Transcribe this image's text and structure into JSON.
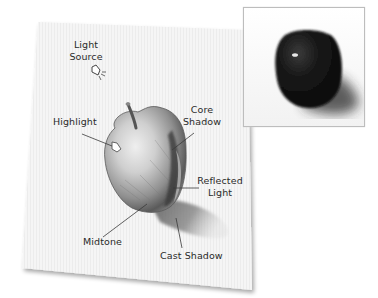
{
  "diagram": {
    "labels": {
      "light_source": [
        "Light",
        "Source"
      ],
      "highlight": "Highlight",
      "core_shadow": [
        "Core",
        "Shadow"
      ],
      "reflected_light": [
        "Reflected",
        "Light"
      ],
      "midtone": "Midtone",
      "cast_shadow": "Cast Shadow"
    },
    "icons": {
      "light_source": "lamp-icon",
      "highlight": "highlight-shape-icon"
    },
    "reference_photo": {
      "subject": "dark apple photograph",
      "background": "#ffffff",
      "apple_color": "#141414"
    },
    "colors": {
      "paper": "#f4f4f4",
      "pencil": "#555555",
      "label_text": "#2a2a2a",
      "leader_line": "#3a3a3a"
    }
  }
}
